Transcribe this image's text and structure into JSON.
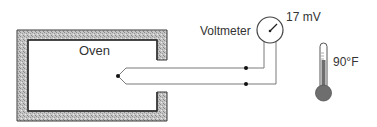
{
  "diagram": {
    "oven": {
      "label": "Oven"
    },
    "voltmeter": {
      "label": "Voltmeter",
      "reading": "17 mV"
    },
    "thermometer": {
      "reading": "90°F"
    },
    "thermocouple": {
      "junction": "measuring junction inside oven",
      "reference_junctions": 2
    }
  },
  "colors": {
    "wall_fill": "#b8b8b8",
    "wall_stroke": "#3a3a3a",
    "wire": "#7a7a7a",
    "thermometer_fill": "#6e6e6e",
    "text": "#333333"
  }
}
